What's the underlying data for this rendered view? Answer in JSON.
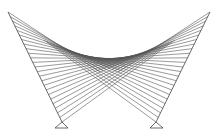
{
  "diagram": {
    "type": "string-art-ruled-curve",
    "width": 219,
    "height": 136,
    "stroke_color": "#555555",
    "background": "#ffffff",
    "fans": [
      {
        "name": "left-fan",
        "edge_start": [
          8,
          12
        ],
        "edge_end": [
          62,
          122
        ],
        "target_start": [
          100,
          72
        ],
        "target_end": [
          175,
          40
        ],
        "segments": 24,
        "base_triangle": [
          [
            62,
            122
          ],
          [
            55,
            128
          ],
          [
            68,
            128
          ]
        ]
      },
      {
        "name": "right-fan",
        "edge_start": [
          210,
          12
        ],
        "edge_end": [
          156,
          122
        ],
        "target_start": [
          118,
          72
        ],
        "target_end": [
          44,
          40
        ],
        "segments": 24,
        "base_triangle": [
          [
            156,
            122
          ],
          [
            150,
            128
          ],
          [
            163,
            128
          ]
        ]
      }
    ]
  }
}
